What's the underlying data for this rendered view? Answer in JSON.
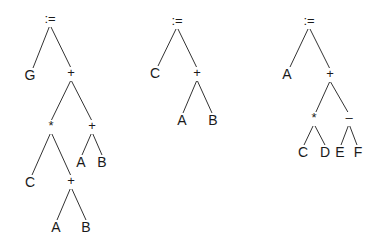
{
  "diagram": {
    "type": "expression-trees",
    "colors": {
      "line": "#333333",
      "text": "#1a1a1a",
      "background": "#ffffff"
    },
    "trees": [
      {
        "name": "tree-1",
        "expression": "G := (C * (A + B)) + (A + B)",
        "nodes": [
          {
            "id": "t1n0",
            "label": ":=",
            "x": 50,
            "y": 20,
            "op": true
          },
          {
            "id": "t1n1",
            "label": "G",
            "x": 30,
            "y": 76
          },
          {
            "id": "t1n2",
            "label": "+",
            "x": 71,
            "y": 74,
            "op": true
          },
          {
            "id": "t1n3",
            "label": "*",
            "x": 51,
            "y": 127,
            "op": true
          },
          {
            "id": "t1n4",
            "label": "+",
            "x": 92,
            "y": 127,
            "op": true
          },
          {
            "id": "t1n5",
            "label": "A",
            "x": 81,
            "y": 163
          },
          {
            "id": "t1n6",
            "label": "B",
            "x": 102,
            "y": 163
          },
          {
            "id": "t1n7",
            "label": "C",
            "x": 30,
            "y": 183
          },
          {
            "id": "t1n8",
            "label": "+",
            "x": 71,
            "y": 182,
            "op": true
          },
          {
            "id": "t1n9",
            "label": "A",
            "x": 56,
            "y": 228
          },
          {
            "id": "t1n10",
            "label": "B",
            "x": 86,
            "y": 228
          }
        ],
        "edges": [
          [
            50,
            25,
            33,
            68
          ],
          [
            50,
            25,
            71,
            68
          ],
          [
            71,
            80,
            51,
            121
          ],
          [
            71,
            80,
            92,
            121
          ],
          [
            92,
            132,
            82,
            155
          ],
          [
            92,
            132,
            102,
            155
          ],
          [
            51,
            132,
            32,
            175
          ],
          [
            51,
            132,
            71,
            176
          ],
          [
            71,
            187,
            57,
            220
          ],
          [
            71,
            187,
            86,
            220
          ]
        ]
      },
      {
        "name": "tree-2",
        "expression": "C := A + B",
        "nodes": [
          {
            "id": "t2n0",
            "label": ":=",
            "x": 177,
            "y": 22,
            "op": true
          },
          {
            "id": "t2n1",
            "label": "C",
            "x": 155,
            "y": 74
          },
          {
            "id": "t2n2",
            "label": "+",
            "x": 197,
            "y": 74,
            "op": true
          },
          {
            "id": "t2n3",
            "label": "A",
            "x": 182,
            "y": 121
          },
          {
            "id": "t2n4",
            "label": "B",
            "x": 213,
            "y": 121
          }
        ],
        "edges": [
          [
            177,
            27,
            158,
            66
          ],
          [
            177,
            27,
            197,
            68
          ],
          [
            197,
            80,
            183,
            113
          ],
          [
            197,
            80,
            212,
            113
          ]
        ]
      },
      {
        "name": "tree-3",
        "expression": "A := (C * D) + (E - F)",
        "nodes": [
          {
            "id": "t3n0",
            "label": ":=",
            "x": 309,
            "y": 22,
            "op": true
          },
          {
            "id": "t3n1",
            "label": "A",
            "x": 287,
            "y": 75
          },
          {
            "id": "t3n2",
            "label": "+",
            "x": 330,
            "y": 75,
            "op": true
          },
          {
            "id": "t3n3",
            "label": "*",
            "x": 314,
            "y": 119,
            "op": true
          },
          {
            "id": "t3n4",
            "label": "–",
            "x": 349,
            "y": 119,
            "op": true
          },
          {
            "id": "t3n5",
            "label": "C",
            "x": 303,
            "y": 153
          },
          {
            "id": "t3n6",
            "label": "D",
            "x": 325,
            "y": 153
          },
          {
            "id": "t3n7",
            "label": "E",
            "x": 340,
            "y": 153
          },
          {
            "id": "t3n8",
            "label": "F",
            "x": 358,
            "y": 153
          }
        ],
        "edges": [
          [
            309,
            27,
            290,
            67
          ],
          [
            309,
            27,
            330,
            69
          ],
          [
            330,
            81,
            315,
            114
          ],
          [
            330,
            81,
            349,
            114
          ],
          [
            314,
            124,
            304,
            145
          ],
          [
            314,
            124,
            325,
            145
          ],
          [
            349,
            124,
            341,
            145
          ],
          [
            349,
            124,
            357,
            145
          ]
        ]
      }
    ]
  }
}
